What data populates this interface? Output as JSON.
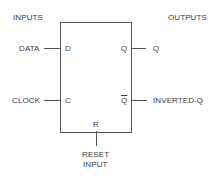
{
  "diagram": {
    "headers": {
      "inputs": "INPUTS",
      "outputs": "OUTPUTS"
    },
    "inputs": [
      {
        "signal": "DATA",
        "pin": "D"
      },
      {
        "signal": "CLOCK",
        "pin": "C"
      }
    ],
    "outputs": [
      {
        "pin": "Q",
        "signal": "Q"
      },
      {
        "pin": "Q",
        "pin_inverted": true,
        "signal": "INVERTED-Q"
      }
    ],
    "reset": {
      "pin": "R",
      "label_line1": "RESET",
      "label_line2": "INPUT"
    },
    "colors": {
      "line": "#555555",
      "text": "#3a3a3a",
      "background": "#ffffff"
    }
  }
}
